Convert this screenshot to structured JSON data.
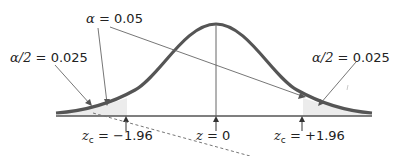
{
  "diagram": {
    "type": "normal-distribution-two-tailed-test",
    "labels": {
      "alpha": {
        "symbol": "α",
        "eq": "=",
        "value": "0.05"
      },
      "left_tail": {
        "symbol": "α/2",
        "eq": "=",
        "value": "0.025"
      },
      "right_tail": {
        "symbol": "α/2",
        "eq": "=",
        "value": "0.025"
      },
      "z_left": {
        "var": "z",
        "sub": "c",
        "eq": "=",
        "value": "−1.96"
      },
      "z_center": {
        "var": "z",
        "eq": "=",
        "value": "0"
      },
      "z_right": {
        "var": "z",
        "sub": "c",
        "eq": "=",
        "value": "+1.96"
      }
    },
    "colors": {
      "curve": "#555555",
      "axis": "#555555",
      "tail_shade": "#ececec",
      "pointer": "#666666",
      "text": "#222222"
    }
  }
}
